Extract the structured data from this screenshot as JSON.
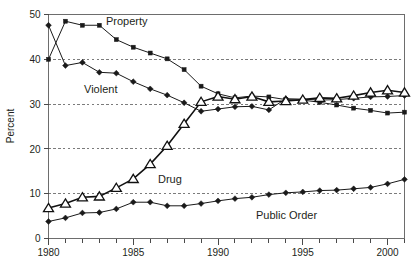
{
  "chart_data": {
    "type": "line",
    "title": "",
    "xlabel": "",
    "ylabel": "Percent",
    "xlim": [
      1980,
      2001
    ],
    "ylim": [
      0,
      50
    ],
    "grid": true,
    "grid_values": [
      10,
      20,
      30,
      40
    ],
    "legend_position": "inline-annotations",
    "x_tick_labels": [
      "1980",
      "1985",
      "1990",
      "1995",
      "2000"
    ],
    "x_tick_values": [
      1980,
      1985,
      1990,
      1995,
      2000
    ],
    "x_minor_tick_values": [
      1981,
      1982,
      1983,
      1984,
      1986,
      1987,
      1988,
      1989,
      1991,
      1992,
      1993,
      1994,
      1996,
      1997,
      1998,
      1999,
      2001
    ],
    "y_tick_labels": [
      "0",
      "10",
      "20",
      "30",
      "40",
      "50"
    ],
    "y_tick_values": [
      0,
      10,
      20,
      30,
      40,
      50
    ],
    "x": [
      1980,
      1981,
      1982,
      1983,
      1984,
      1985,
      1986,
      1987,
      1988,
      1989,
      1990,
      1991,
      1992,
      1993,
      1994,
      1995,
      1996,
      1997,
      1998,
      1999,
      2000,
      2001
    ],
    "series": [
      {
        "name": "Property",
        "label": "Property",
        "marker": "square",
        "line_weight": "thin",
        "values": [
          40.0,
          48.5,
          47.6,
          47.6,
          44.4,
          42.7,
          41.4,
          40.1,
          37.7,
          34.0,
          32.3,
          31.4,
          31.8,
          31.6,
          31.0,
          30.9,
          30.4,
          29.8,
          29.1,
          28.6,
          28.0,
          28.2
        ]
      },
      {
        "name": "Violent",
        "label": "Violent",
        "marker": "diamond",
        "line_weight": "thin",
        "values": [
          47.6,
          38.6,
          39.3,
          37.1,
          36.9,
          35.0,
          33.4,
          32.0,
          30.3,
          28.4,
          28.9,
          29.4,
          29.5,
          28.7,
          31.2,
          31.1,
          30.9,
          31.0,
          31.3,
          31.6,
          31.7,
          31.9
        ]
      },
      {
        "name": "Drug",
        "label": "Drug",
        "marker": "triangle",
        "line_weight": "thick",
        "values": [
          6.8,
          7.8,
          9.2,
          9.4,
          11.3,
          13.3,
          16.6,
          20.7,
          25.6,
          30.5,
          31.7,
          31.1,
          31.7,
          30.5,
          30.7,
          31.0,
          31.4,
          31.3,
          31.9,
          32.6,
          33.1,
          32.6
        ]
      },
      {
        "name": "Public Order",
        "label": "Public Order",
        "marker": "diamond",
        "line_weight": "thin",
        "values": [
          3.8,
          4.6,
          5.7,
          5.8,
          6.6,
          8.1,
          8.1,
          7.3,
          7.3,
          7.8,
          8.4,
          8.9,
          9.2,
          9.8,
          10.2,
          10.4,
          10.7,
          10.8,
          11.1,
          11.4,
          12.2,
          13.2
        ]
      }
    ],
    "annotations": [
      {
        "text": "Property",
        "x_px": 106,
        "y_px": 25
      },
      {
        "text": "Violent",
        "x_px": 84,
        "y_px": 93
      },
      {
        "text": "Drug",
        "x_px": 158,
        "y_px": 183
      },
      {
        "text": "Public Order",
        "x_px": 256,
        "y_px": 219
      }
    ]
  },
  "colors": {
    "ink": "#1a1a1a",
    "axis": "#6d6d6d",
    "grid": "#6d6d6d",
    "background": "#ffffff",
    "marker_fill_open": "#ffffff"
  }
}
